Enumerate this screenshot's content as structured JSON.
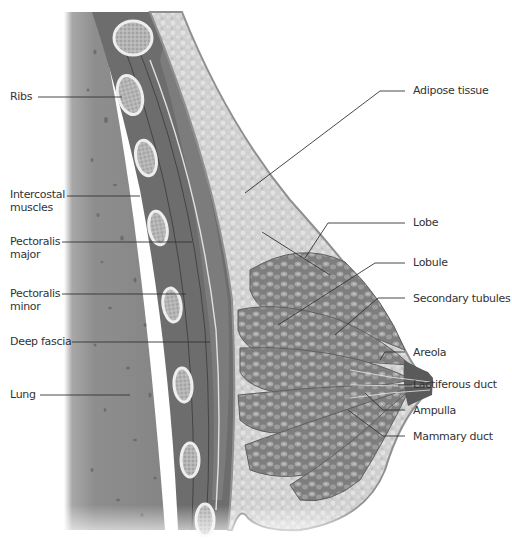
{
  "figure": {
    "palette": {
      "background": "#ffffff",
      "lung": "#8c8c8c",
      "lung_dark": "#6f6f6f",
      "muscle": "#6b6b6b",
      "muscle_light": "#8a8a8a",
      "bone": "#d8d8d8",
      "bone_marrow": "#a9a9a9",
      "adipose": "#d2d2d2",
      "gland": "#8e8e8e",
      "skin": "#9a9a9a",
      "leader_line": "#333333",
      "label_text": "#333333"
    }
  },
  "labels_left": [
    {
      "id": "ribs",
      "text": "Ribs"
    },
    {
      "id": "intercostal",
      "line1": "Intercostal",
      "line2": "muscles"
    },
    {
      "id": "pect-major",
      "line1": "Pectoralis",
      "line2": "major"
    },
    {
      "id": "pect-minor",
      "line1": "Pectoralis",
      "line2": "minor"
    },
    {
      "id": "deep-fascia",
      "text": "Deep fascia"
    },
    {
      "id": "lung",
      "text": "Lung"
    }
  ],
  "labels_right": [
    {
      "id": "adipose",
      "text": "Adipose tissue"
    },
    {
      "id": "lobe",
      "text": "Lobe"
    },
    {
      "id": "lobule",
      "text": "Lobule"
    },
    {
      "id": "secondary-tubules",
      "text": "Secondary tubules"
    },
    {
      "id": "areola",
      "text": "Areola"
    },
    {
      "id": "lactiferous",
      "text": "Lactiferous duct"
    },
    {
      "id": "ampulla",
      "text": "Ampulla"
    },
    {
      "id": "mammary-duct",
      "text": "Mammary duct"
    }
  ]
}
